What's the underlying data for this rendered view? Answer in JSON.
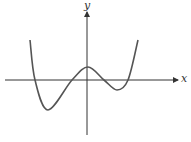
{
  "chart_data": {
    "type": "line",
    "title": "",
    "xlabel": "x",
    "ylabel": "y",
    "grid": false,
    "legend": null,
    "ticks": {
      "x": [],
      "y": []
    },
    "series": [
      {
        "name": "f(x)",
        "points_px": [
          [
            30,
            40
          ],
          [
            35,
            80
          ],
          [
            48,
            110
          ],
          [
            72,
            80
          ],
          [
            88,
            67
          ],
          [
            104,
            80
          ],
          [
            117,
            90
          ],
          [
            128,
            80
          ],
          [
            138,
            40
          ]
        ],
        "key_points": {
          "left_end": [
            30,
            40
          ],
          "x_intercepts_px": [
            35,
            72,
            104,
            128
          ],
          "local_min_left": [
            48,
            110
          ],
          "local_max": [
            88,
            67
          ],
          "local_min_right": [
            117,
            90
          ],
          "right_end": [
            138,
            40
          ]
        }
      }
    ],
    "axes_px": {
      "origin": [
        87,
        80
      ],
      "x_axis": {
        "from": 5,
        "to": 178,
        "y": 80,
        "arrow": "right"
      },
      "y_axis": {
        "from": 135,
        "to": 12,
        "x": 87,
        "arrow": "up"
      }
    }
  },
  "colors": {
    "axis": "#333333",
    "curve": "#555555",
    "background": "#ffffff"
  },
  "labels": {
    "x": "x",
    "y": "y"
  }
}
